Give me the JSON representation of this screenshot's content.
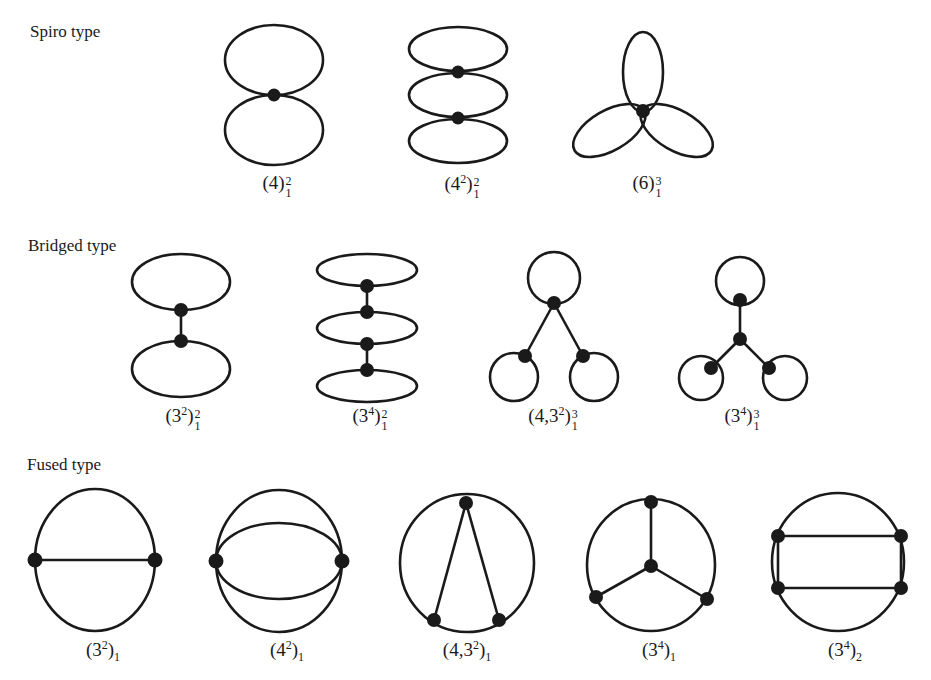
{
  "figure": {
    "sections": [
      {
        "id": "spiro",
        "label": "Spiro type",
        "items": [
          {
            "name": "(4)",
            "base": "4",
            "base_exp": "",
            "sup": "2",
            "sub": "1"
          },
          {
            "name": "(4^2)",
            "base": "4",
            "base_exp": "2",
            "sup": "2",
            "sub": "1"
          },
          {
            "name": "(6)",
            "base": "6",
            "base_exp": "",
            "sup": "3",
            "sub": "1"
          }
        ]
      },
      {
        "id": "bridged",
        "label": "Bridged type",
        "items": [
          {
            "name": "(3^2)",
            "base": "3",
            "base_exp": "2",
            "sup": "2",
            "sub": "1"
          },
          {
            "name": "(3^4)",
            "base": "3",
            "base_exp": "4",
            "sup": "2",
            "sub": "1"
          },
          {
            "name": "(4,3^2)",
            "base": "4,3",
            "base_exp": "2",
            "sup": "3",
            "sub": "1"
          },
          {
            "name": "(3^4)",
            "base": "3",
            "base_exp": "4",
            "sup": "3",
            "sub": "1"
          }
        ]
      },
      {
        "id": "fused",
        "label": "Fused type",
        "items": [
          {
            "name": "(3^2)",
            "base": "3",
            "base_exp": "2",
            "sup": "",
            "sub": "1"
          },
          {
            "name": "(4^2)",
            "base": "4",
            "base_exp": "2",
            "sup": "",
            "sub": "1"
          },
          {
            "name": "(4,3^2)",
            "base": "4,3",
            "base_exp": "2",
            "sup": "",
            "sub": "1"
          },
          {
            "name": "(3^4)",
            "base": "3",
            "base_exp": "4",
            "sup": "",
            "sub": "1"
          },
          {
            "name": "(3^4)",
            "base": "3",
            "base_exp": "4",
            "sup": "",
            "sub": "2"
          }
        ]
      }
    ],
    "colors": {
      "ink": "#1a1a1a",
      "background": "#ffffff"
    }
  }
}
